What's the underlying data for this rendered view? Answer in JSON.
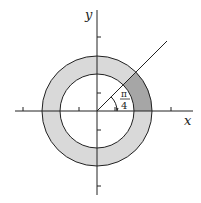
{
  "diagram": {
    "type": "polar-region",
    "axes": {
      "x_label": "x",
      "y_label": "y"
    },
    "origin_px": [
      97,
      111
    ],
    "unit_px": 18.5,
    "annulus": {
      "inner_radius": 2,
      "outer_radius": 3,
      "fill": "#d9d9d9"
    },
    "sector": {
      "start_angle": 0,
      "end_angle_label": "π/4",
      "fill": "#a6a6a6"
    },
    "ray_angle_label": {
      "numerator": "π",
      "denominator": "4"
    },
    "ticks": [
      -4,
      -1,
      1,
      4
    ],
    "colors": {
      "stroke": "#222222",
      "annulus": "#d9d9d9",
      "sector": "#a6a6a6"
    }
  }
}
